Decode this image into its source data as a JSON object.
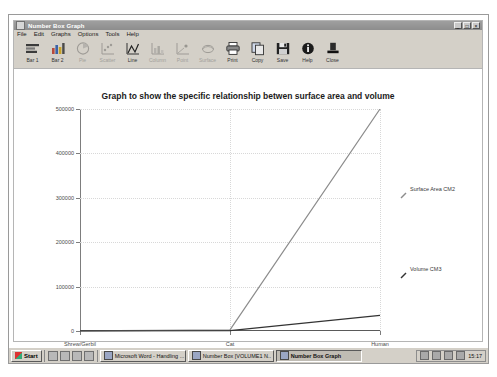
{
  "window": {
    "title": "Number Box Graph",
    "sysicon_name": "window-system-icon",
    "controls": [
      {
        "name": "minimize-button",
        "glyph": "_"
      },
      {
        "name": "maximize-button",
        "glyph": "□"
      },
      {
        "name": "close-button",
        "glyph": "×"
      }
    ]
  },
  "menubar": {
    "items": [
      {
        "label": "File"
      },
      {
        "label": "Edit"
      },
      {
        "label": "Graphs"
      },
      {
        "label": "Options"
      },
      {
        "label": "Tools"
      },
      {
        "label": "Help"
      }
    ]
  },
  "toolbar": {
    "buttons": [
      {
        "label": "Bar 1",
        "icon": "bar1-icon",
        "enabled": true
      },
      {
        "label": "Bar 2",
        "icon": "bar2-icon",
        "enabled": true
      },
      {
        "label": "Pie",
        "icon": "pie-icon",
        "enabled": false
      },
      {
        "label": "Scatter",
        "icon": "scatter-icon",
        "enabled": false
      },
      {
        "label": "Line",
        "icon": "line-icon",
        "enabled": true
      },
      {
        "label": "Column",
        "icon": "column-icon",
        "enabled": false
      },
      {
        "label": "Point",
        "icon": "point-icon",
        "enabled": false
      },
      {
        "label": "Surface",
        "icon": "surface-icon",
        "enabled": false
      },
      {
        "label": "Print",
        "icon": "print-icon",
        "enabled": true
      },
      {
        "label": "Copy",
        "icon": "copy-icon",
        "enabled": true
      },
      {
        "label": "Save",
        "icon": "save-icon",
        "enabled": true
      },
      {
        "label": "Help",
        "icon": "help-icon",
        "enabled": true
      },
      {
        "label": "Close",
        "icon": "close-icon",
        "enabled": true
      }
    ]
  },
  "chart_data": {
    "type": "line",
    "title": "Graph to show the specific relationship betwen surface area and volume",
    "xlabel": "",
    "ylabel": "",
    "categories": [
      "Shrew/Gerbil",
      "Cat",
      "Human"
    ],
    "ylim": [
      0,
      500000
    ],
    "yticks": [
      0,
      100000,
      200000,
      300000,
      400000,
      500000
    ],
    "ytick_labels": [
      "0",
      "100000",
      "200000",
      "300000",
      "400000",
      "500000"
    ],
    "grid": true,
    "legend_position": "right",
    "series": [
      {
        "name": "Surface Area CM2",
        "color": "#8c8c8c",
        "values": [
          200,
          2500,
          500000
        ]
      },
      {
        "name": "Volume CM3",
        "color": "#333333",
        "values": [
          60,
          900,
          35000
        ]
      }
    ]
  },
  "taskbar": {
    "start_label": "Start",
    "quicklaunch_icons": [
      "show-desktop-icon",
      "internet-explorer-icon",
      "outlook-express-icon",
      "media-player-icon"
    ],
    "tasks": [
      {
        "label": "Microsoft Word - Handling ...",
        "active": false
      },
      {
        "label": "Number Box [VOLUME1 N..",
        "active": false
      },
      {
        "label": "Number Box Graph",
        "active": true
      }
    ],
    "tray_icons": [
      "volume-icon",
      "network-icon",
      "printer-icon",
      "antivirus-icon"
    ],
    "clock": "15:17"
  }
}
